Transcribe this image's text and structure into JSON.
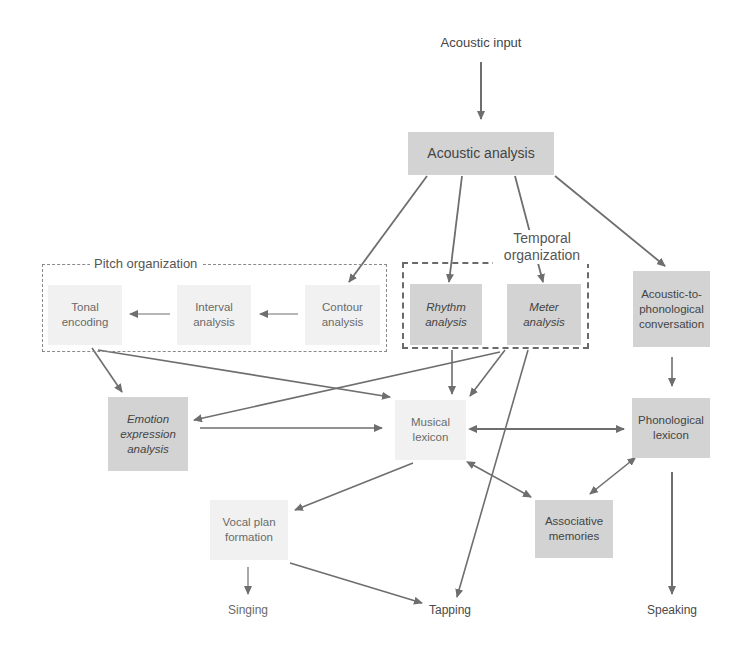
{
  "diagram": {
    "top_input": "Acoustic input",
    "nodes": {
      "acoustic_analysis": "Acoustic analysis",
      "tonal_encoding": "Tonal encoding",
      "interval_analysis": "Interval analysis",
      "contour_analysis": "Contour analysis",
      "rhythm_analysis": "Rhythm analysis",
      "meter_analysis": "Meter analysis",
      "acoustic_to_phonological": "Acoustic-to-phonological conversation",
      "emotion_expression": "Emotion expression analysis",
      "musical_lexicon": "Musical lexicon",
      "phonological_lexicon": "Phonological lexicon",
      "associative_memories": "Associative memories",
      "vocal_plan": "Vocal plan formation"
    },
    "groups": {
      "pitch": "Pitch organization",
      "temporal": "Temporal organization"
    },
    "outputs": {
      "singing": "Singing",
      "tapping": "Tapping",
      "speaking": "Speaking"
    },
    "colors": {
      "dark_box": "#d3d3d3",
      "light_box": "#f1f1f1",
      "arrow": "#6e6e6e"
    }
  }
}
